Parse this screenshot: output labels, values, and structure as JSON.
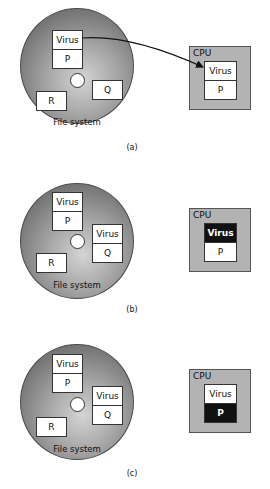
{
  "figure": {
    "panels": [
      {
        "caption": "(a)",
        "file_system": {
          "label": "File system",
          "files": [
            {
              "name": "P",
              "infected": true,
              "rows": [
                "Virus",
                "P"
              ]
            },
            {
              "name": "Q",
              "infected": false,
              "rows": [
                "Q"
              ]
            },
            {
              "name": "R",
              "infected": false,
              "rows": [
                "R"
              ]
            }
          ]
        },
        "cpu": {
          "label": "CPU",
          "rows": [
            "Virus",
            "P"
          ],
          "executing": "none"
        },
        "arrow": "P loaded from file system into CPU"
      },
      {
        "caption": "(b)",
        "file_system": {
          "label": "File system",
          "files": [
            {
              "name": "P",
              "infected": true,
              "rows": [
                "Virus",
                "P"
              ]
            },
            {
              "name": "Q",
              "infected": true,
              "rows": [
                "Virus",
                "Q"
              ]
            },
            {
              "name": "R",
              "infected": false,
              "rows": [
                "R"
              ]
            }
          ]
        },
        "cpu": {
          "label": "CPU",
          "rows": [
            "Virus",
            "P"
          ],
          "executing": "Virus"
        }
      },
      {
        "caption": "(c)",
        "file_system": {
          "label": "File system",
          "files": [
            {
              "name": "P",
              "infected": true,
              "rows": [
                "Virus",
                "P"
              ]
            },
            {
              "name": "Q",
              "infected": true,
              "rows": [
                "Virus",
                "Q"
              ]
            },
            {
              "name": "R",
              "infected": false,
              "rows": [
                "R"
              ]
            }
          ]
        },
        "cpu": {
          "label": "CPU",
          "rows": [
            "Virus",
            "P"
          ],
          "executing": "P"
        }
      }
    ],
    "colors": {
      "disk_dark": "#5a5a5a",
      "disk_light": "#d4d4d4",
      "cpu_fill": "#b3b3b3",
      "executing_fill": "#111111"
    }
  }
}
